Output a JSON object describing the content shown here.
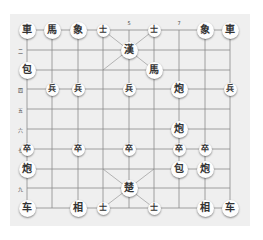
{
  "board": {
    "background": "#efefef",
    "grid_color": "#8a8a8a",
    "columns_x": [
      27,
      52,
      78,
      103,
      129,
      154,
      179,
      205,
      230
    ],
    "rows_y": [
      30,
      50,
      70,
      89,
      109,
      129,
      149,
      169,
      188,
      208
    ]
  },
  "labels": {
    "top": [
      {
        "text": "5",
        "col": 4
      },
      {
        "text": "7",
        "col": 6
      }
    ],
    "left": [
      {
        "text": "二",
        "row": 1
      },
      {
        "text": "四",
        "row": 3
      },
      {
        "text": "五",
        "row": 4
      },
      {
        "text": "六",
        "row": 5
      },
      {
        "text": "七",
        "row": 6
      },
      {
        "text": "九",
        "row": 8
      }
    ]
  },
  "pieces": [
    {
      "char": "車",
      "col": 0,
      "row": 0,
      "size": "big"
    },
    {
      "char": "馬",
      "col": 1,
      "row": 0,
      "size": "big"
    },
    {
      "char": "象",
      "col": 2,
      "row": 0,
      "size": "big"
    },
    {
      "char": "士",
      "col": 3,
      "row": 0,
      "size": "small"
    },
    {
      "char": "士",
      "col": 5,
      "row": 0,
      "size": "small"
    },
    {
      "char": "象",
      "col": 7,
      "row": 0,
      "size": "big"
    },
    {
      "char": "車",
      "col": 8,
      "row": 0,
      "size": "big"
    },
    {
      "char": "漢",
      "col": 4,
      "row": 1,
      "size": "big"
    },
    {
      "char": "包",
      "col": 0,
      "row": 2,
      "size": "big"
    },
    {
      "char": "馬",
      "col": 5,
      "row": 2,
      "size": "big"
    },
    {
      "char": "兵",
      "col": 1,
      "row": 3,
      "size": "small"
    },
    {
      "char": "兵",
      "col": 2,
      "row": 3,
      "size": "small"
    },
    {
      "char": "兵",
      "col": 4,
      "row": 3,
      "size": "small"
    },
    {
      "char": "炮",
      "col": 6,
      "row": 3,
      "size": "big"
    },
    {
      "char": "兵",
      "col": 8,
      "row": 3,
      "size": "small"
    },
    {
      "char": "炮",
      "col": 6,
      "row": 5,
      "size": "big"
    },
    {
      "char": "卒",
      "col": 0,
      "row": 6,
      "size": "small"
    },
    {
      "char": "卒",
      "col": 2,
      "row": 6,
      "size": "small"
    },
    {
      "char": "卒",
      "col": 4,
      "row": 6,
      "size": "small"
    },
    {
      "char": "卒",
      "col": 6,
      "row": 6,
      "size": "small"
    },
    {
      "char": "卒",
      "col": 7,
      "row": 6,
      "size": "small"
    },
    {
      "char": "炮",
      "col": 0,
      "row": 7,
      "size": "big"
    },
    {
      "char": "包",
      "col": 6,
      "row": 7,
      "size": "big"
    },
    {
      "char": "炮",
      "col": 7,
      "row": 7,
      "size": "big"
    },
    {
      "char": "楚",
      "col": 4,
      "row": 8,
      "size": "big"
    },
    {
      "char": "车",
      "col": 0,
      "row": 9,
      "size": "big"
    },
    {
      "char": "相",
      "col": 2,
      "row": 9,
      "size": "big"
    },
    {
      "char": "士",
      "col": 3,
      "row": 9,
      "size": "small"
    },
    {
      "char": "士",
      "col": 5,
      "row": 9,
      "size": "small"
    },
    {
      "char": "相",
      "col": 7,
      "row": 9,
      "size": "big"
    },
    {
      "char": "车",
      "col": 8,
      "row": 9,
      "size": "big"
    }
  ]
}
